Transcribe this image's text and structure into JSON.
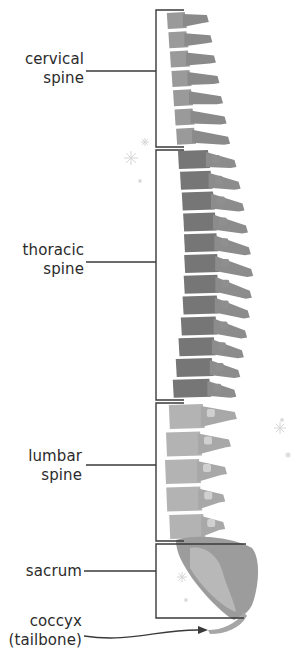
{
  "diagram": {
    "colors": {
      "line": "#3a3a3a",
      "cervical": "#9a9a9a",
      "cervical_dark": "#8a8a8a",
      "thoracic": "#767676",
      "thoracic_process": "#8c8c8c",
      "lumbar": "#b3b3b3",
      "lumbar_process": "#a8a8a8",
      "lumbar_highlight": "#d0d0d0",
      "sacrum_light": "#b8b8b8",
      "sacrum_dark": "#9c9c9c",
      "coccyx": "#a6a6a6",
      "sparkle": "#d6d6d6"
    },
    "regions": [
      {
        "id": "cervical",
        "line1": "cervical",
        "line2": "spine",
        "label_x": 84,
        "label_y": 52,
        "leader_y": 71,
        "bracket_top": 10,
        "bracket_bottom": 147,
        "count": 7
      },
      {
        "id": "thoracic",
        "line1": "thoracic",
        "line2": "spine",
        "label_x": 84,
        "label_y": 243,
        "leader_y": 262,
        "bracket_top": 150,
        "bracket_bottom": 400,
        "count": 12
      },
      {
        "id": "lumbar",
        "line1": "lumbar",
        "line2": "spine",
        "label_x": 82,
        "label_y": 449,
        "leader_y": 465,
        "bracket_top": 403,
        "bracket_bottom": 541,
        "count": 5
      },
      {
        "id": "sacrum",
        "line1": "sacrum",
        "line2": "",
        "label_x": 82,
        "label_y": 562,
        "leader_y": 571,
        "bracket_top": 544,
        "bracket_bottom": 618
      },
      {
        "id": "coccyx",
        "line1": "coccyx",
        "line2": "(tailbone)",
        "label_x": 82,
        "label_y": 613,
        "arrow_y": 631
      }
    ],
    "bracket_x": 156
  }
}
